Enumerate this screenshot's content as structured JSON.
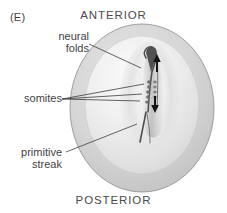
{
  "figure": {
    "panel_label": "(E)",
    "orientation": {
      "anterior": "ANTERIOR",
      "posterior": "POSTERIOR"
    },
    "annotations": {
      "neural_folds": "neural\nfolds",
      "somites": "somites",
      "primitive_streak": "primitive\nstreak"
    },
    "colors": {
      "background": "#ffffff",
      "disc_rim": "#c9c9c9",
      "disc_inner": "#e2e2e2",
      "disc_highlight": "#f2f2f2",
      "outline": "#8d8d8d",
      "structure_dark": "#4a4a4a",
      "text": "#3f3f3f",
      "arrow": "#1a1a1a"
    },
    "graphic": {
      "type": "embryo-diagram",
      "subject": "neurula-stage embryo disc",
      "disc": {
        "center_x": 142,
        "center_y": 108,
        "radius_x": 72,
        "radius_y": 84
      },
      "arrows": [
        {
          "name": "anterior-extension-arrow",
          "direction": "up",
          "x": 157,
          "y_top": 56,
          "y_bottom": 72
        },
        {
          "name": "posterior-extension-arrow",
          "direction": "down",
          "x": 155,
          "y_top": 96,
          "y_bottom": 112
        }
      ],
      "leader_lines": [
        {
          "name": "neural-folds-leader",
          "from_x": 89,
          "from_y": 44,
          "to_x": 141,
          "to_y": 68
        },
        {
          "name": "somites-leader-1",
          "from_x": 62,
          "from_y": 99,
          "to_x": 143,
          "to_y": 84
        },
        {
          "name": "somites-leader-2",
          "from_x": 62,
          "from_y": 99,
          "to_x": 141,
          "to_y": 94
        },
        {
          "name": "somites-leader-3",
          "from_x": 62,
          "from_y": 99,
          "to_x": 140,
          "to_y": 101
        },
        {
          "name": "primitive-streak-leader",
          "from_x": 66,
          "from_y": 152,
          "to_x": 137,
          "to_y": 124
        }
      ]
    }
  }
}
